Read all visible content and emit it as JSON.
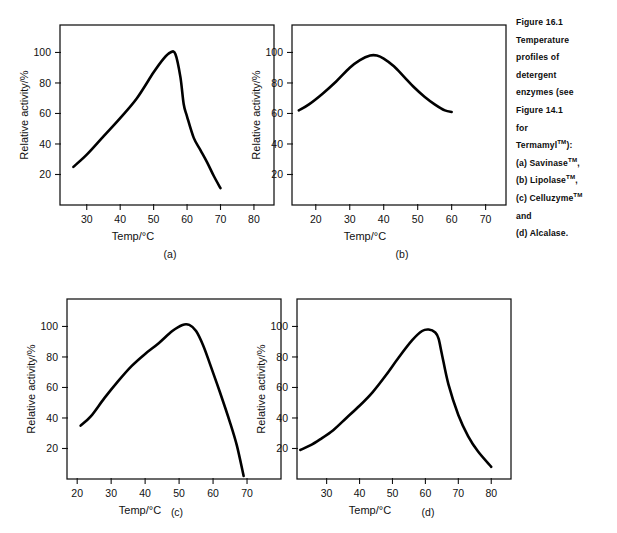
{
  "figure": {
    "caption_lines": [
      "Figure 16.1",
      "Temperature",
      "profiles of",
      "detergent",
      "enzymes (see",
      "Figure 14.1",
      "for",
      "Termamyl™):",
      "(a) Savinase™,",
      "(b) Lipolase™,",
      "(c) Celluzyme™",
      "and",
      "(d) Alcalase."
    ],
    "caption_full": "Figure 16.1 Temperature profiles of detergent enzymes (see Figure 14.1 for Termamyl™): (a) Savinase™, (b) Lipolase™, (c) Celluzyme™ and (d) Alcalase."
  },
  "chart_data": [
    {
      "id": "a",
      "type": "line",
      "panel_label": "(a)",
      "enzyme": "Savinase™",
      "title": "",
      "xlabel": "Temp/°C",
      "ylabel": "Relative activity/%",
      "xlim": [
        22,
        86
      ],
      "ylim": [
        0,
        118
      ],
      "xticks": [
        30,
        40,
        50,
        60,
        70,
        80
      ],
      "yticks": [
        20,
        40,
        60,
        80,
        100
      ],
      "grid": false,
      "legend": "none",
      "x": [
        26,
        30,
        35,
        40,
        45,
        50,
        53,
        55,
        56.5,
        58,
        59,
        60,
        62,
        64,
        66,
        68,
        70
      ],
      "y": [
        25,
        33,
        45,
        57,
        70,
        87,
        96,
        100,
        99,
        84,
        66,
        58,
        44,
        36,
        28,
        19,
        11
      ]
    },
    {
      "id": "b",
      "type": "line",
      "panel_label": "(b)",
      "enzyme": "Lipolase™",
      "title": "",
      "xlabel": "Temp/°C",
      "ylabel": "Relative activity/%",
      "xlim": [
        13,
        76
      ],
      "ylim": [
        0,
        118
      ],
      "xticks": [
        20,
        30,
        40,
        50,
        60,
        70
      ],
      "yticks": [
        20,
        40,
        60,
        80,
        100
      ],
      "grid": false,
      "legend": "none",
      "x": [
        15,
        18,
        22,
        26,
        30,
        33,
        36,
        38,
        40,
        43,
        46,
        49,
        52,
        55,
        58,
        60
      ],
      "y": [
        62,
        66,
        73,
        81,
        90,
        95,
        98,
        98,
        96,
        91,
        84,
        77,
        71,
        66,
        62,
        61
      ]
    },
    {
      "id": "c",
      "type": "line",
      "panel_label": "(c)",
      "enzyme": "Celluzyme™",
      "title": "",
      "xlabel": "Temp/°C",
      "ylabel": "Relative activity/%",
      "xlim": [
        17,
        80
      ],
      "ylim": [
        0,
        118
      ],
      "xticks": [
        20,
        30,
        40,
        50,
        60,
        70
      ],
      "yticks": [
        20,
        40,
        60,
        80,
        100
      ],
      "grid": false,
      "legend": "none",
      "x": [
        21,
        24,
        28,
        32,
        36,
        40,
        44,
        48,
        51,
        53,
        55,
        57,
        59,
        62,
        65,
        67,
        69
      ],
      "y": [
        35,
        41,
        53,
        64,
        74,
        82,
        89,
        97,
        101,
        101,
        97,
        88,
        76,
        57,
        37,
        22,
        2
      ]
    },
    {
      "id": "d",
      "type": "line",
      "panel_label": "(d)",
      "enzyme": "Alcalase™",
      "title": "",
      "xlabel": "Temp/°C",
      "ylabel": "Relative activity/%",
      "xlim": [
        21,
        86
      ],
      "ylim": [
        0,
        118
      ],
      "xticks": [
        30,
        40,
        50,
        60,
        70,
        80
      ],
      "yticks": [
        20,
        40,
        60,
        80,
        100
      ],
      "grid": false,
      "legend": "none",
      "x": [
        22,
        25,
        28,
        32,
        36,
        40,
        44,
        48,
        52,
        56,
        59,
        61,
        63,
        64,
        65,
        67,
        70,
        73,
        76,
        80
      ],
      "y": [
        19,
        22,
        26,
        32,
        40,
        48,
        57,
        68,
        80,
        91,
        97,
        98,
        96,
        92,
        82,
        62,
        42,
        28,
        18,
        8
      ]
    }
  ]
}
